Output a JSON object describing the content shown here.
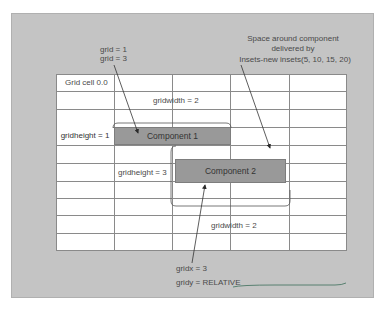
{
  "diagram": {
    "title_note": {
      "line1": "grid = 1",
      "line2": "grid = 3"
    },
    "insets_note": {
      "line1": "Space around component",
      "line2": "delivered by",
      "line3": "Insets-new insets(5, 10, 15, 20)"
    },
    "grid": {
      "columns": 5,
      "rows": 10,
      "cell_label": "Grid cell 0.0"
    },
    "labels": {
      "gridwidth_top": "gridwidth = 2",
      "gridheight_1": "gridheight = 1",
      "gridheight_3": "gridheight = 3",
      "gridwidth_bottom": "gridwidth = 2",
      "gridx": "gridx = 3",
      "gridy": "gridy = RELATIVE"
    },
    "components": [
      {
        "label": "Component 1"
      },
      {
        "label": "Component 2"
      }
    ],
    "colors": {
      "panel": "#c4c4c4",
      "grid_bg": "#ffffff",
      "grid_lines": "#8a8a8a",
      "component_fill": "#999999",
      "annotation_ink": "#4a4a4a",
      "underline_ink": "#3c6e5a"
    }
  }
}
